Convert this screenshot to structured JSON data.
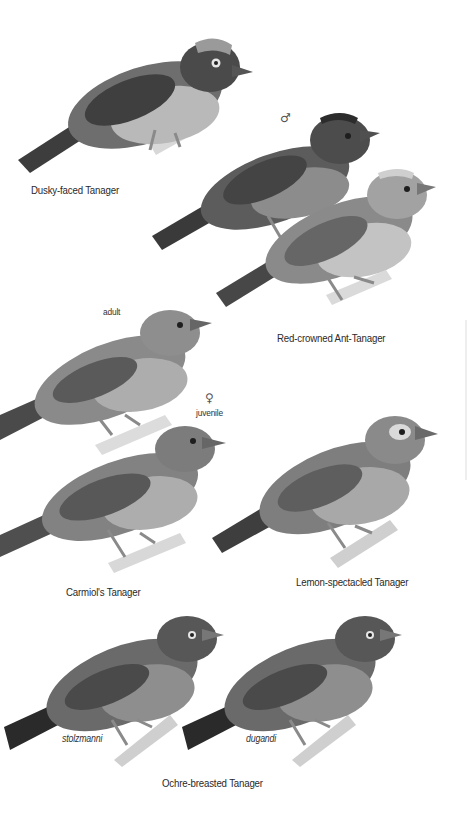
{
  "plate": {
    "species": [
      {
        "id": "dusky-faced",
        "label": "Dusky-faced Tanager"
      },
      {
        "id": "red-crowned",
        "label": "Red-crowned Ant-Tanager",
        "forms": [
          {
            "sex": "male",
            "symbol": "♂"
          },
          {
            "sex": "female",
            "symbol": "♀"
          }
        ]
      },
      {
        "id": "carmiol",
        "label": "Carmiol's Tanager",
        "forms": [
          {
            "age": "adult",
            "label": "adult"
          },
          {
            "age": "juvenile",
            "label": "juvenile",
            "symbol": "♀"
          }
        ]
      },
      {
        "id": "lemon-spectacled",
        "label": "Lemon-spectacled Tanager"
      },
      {
        "id": "ochre-breasted",
        "label": "Ochre-breasted Tanager",
        "subspecies": [
          {
            "label": "stolzmanni"
          },
          {
            "label": "dugandi"
          }
        ]
      }
    ],
    "colors": {
      "background": "#ffffff",
      "bird_dark": "#3c3c3c",
      "bird_mid": "#7a7a7a",
      "bird_light": "#b5b5b5",
      "branch": "#d4d4d4"
    }
  }
}
